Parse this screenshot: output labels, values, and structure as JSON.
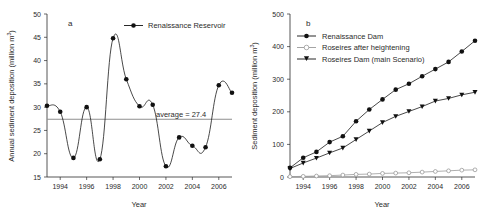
{
  "figure": {
    "panels": [
      {
        "id": "a",
        "label": "a",
        "xlabel": "Year",
        "ylabel_main": "Annual sediment deposition (million m",
        "ylabel_sup": "3",
        "ylabel_tail": ")",
        "annotation": "average = 27.4",
        "legend": [
          {
            "label": "Renaissance Reservoir",
            "marker": "filled-circle",
            "color": "#111111"
          }
        ],
        "yticks": [
          "15",
          "20",
          "25",
          "30",
          "35",
          "40",
          "45",
          "50"
        ],
        "xticks": [
          "1994",
          "1996",
          "1998",
          "2000",
          "2002",
          "2004",
          "2006"
        ]
      },
      {
        "id": "b",
        "label": "b",
        "xlabel": "Year",
        "ylabel_main": "Sediment deposition (million m",
        "ylabel_sup": "3",
        "ylabel_tail": ")",
        "legend": [
          {
            "label": "Renaissance Dam",
            "marker": "filled-circle",
            "color": "#111111"
          },
          {
            "label": "Roseires after heightening",
            "marker": "open-circle",
            "color": "#9a9a9a"
          },
          {
            "label": "Roseires Dam (main Scenario)",
            "marker": "filled-triangle",
            "color": "#111111"
          }
        ],
        "yticks": [
          "0",
          "100",
          "200",
          "300",
          "400",
          "500"
        ],
        "xticks": [
          "1994",
          "1996",
          "1998",
          "2000",
          "2002",
          "2004",
          "2006"
        ]
      }
    ]
  },
  "chart_data": [
    {
      "type": "line",
      "panel": "a",
      "title": "a",
      "xlabel": "Year",
      "ylabel": "Annual sediment deposition (million m3)",
      "xlim": [
        1993,
        2007
      ],
      "ylim": [
        15,
        50
      ],
      "yticks": [
        15,
        20,
        25,
        30,
        35,
        40,
        45,
        50
      ],
      "xticks": [
        1994,
        1996,
        1998,
        2000,
        2002,
        2004,
        2006
      ],
      "grid": false,
      "legend_position": "top-center",
      "annotations": [
        {
          "text": "average = 27.4",
          "value": 27.4,
          "type": "horizontal-reference-line"
        }
      ],
      "x": [
        1993,
        1994,
        1995,
        1996,
        1997,
        1998,
        1999,
        2000,
        2001,
        2002,
        2003,
        2004,
        2005,
        2006,
        2007
      ],
      "series": [
        {
          "name": "Renaissance Reservoir",
          "marker": "filled-circle",
          "values": [
            30.3,
            29.0,
            19.1,
            30.0,
            18.8,
            44.8,
            36.0,
            30.2,
            30.5,
            17.3,
            23.5,
            21.7,
            21.4,
            34.7,
            33.1
          ]
        }
      ]
    },
    {
      "type": "line",
      "panel": "b",
      "title": "b",
      "xlabel": "Year",
      "ylabel": "Sediment deposition (million m3)",
      "xlim": [
        1993,
        2007
      ],
      "ylim": [
        0,
        500
      ],
      "yticks": [
        0,
        100,
        200,
        300,
        400,
        500
      ],
      "xticks": [
        1994,
        1996,
        1998,
        2000,
        2002,
        2004,
        2006
      ],
      "grid": false,
      "legend_position": "top-left",
      "x": [
        1993,
        1994,
        1995,
        1996,
        1997,
        1998,
        1999,
        2000,
        2001,
        2002,
        2003,
        2004,
        2005,
        2006,
        2007
      ],
      "series": [
        {
          "name": "Renaissance Dam",
          "marker": "filled-circle",
          "values": [
            28,
            59,
            77,
            107,
            125,
            171,
            207,
            238,
            268,
            286,
            309,
            331,
            353,
            385,
            418
          ]
        },
        {
          "name": "Roseires after heightening",
          "marker": "open-circle",
          "values": [
            1,
            2,
            3,
            4,
            6,
            8,
            9,
            11,
            12,
            13,
            15,
            17,
            19,
            21,
            22
          ]
        },
        {
          "name": "Roseires Dam (main Scenario)",
          "marker": "filled-triangle",
          "values": [
            26,
            43,
            58,
            74,
            89,
            115,
            141,
            167,
            186,
            201,
            216,
            233,
            241,
            252,
            260
          ]
        }
      ]
    }
  ]
}
